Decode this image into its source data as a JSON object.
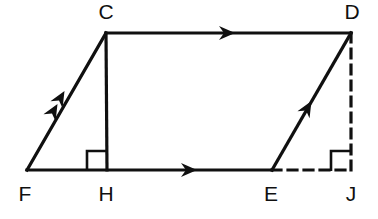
{
  "figure": {
    "background_color": "#ffffff",
    "stroke_color": "#101010",
    "solid_stroke_width": 3.2,
    "dashed_stroke_width": 3.2,
    "dash_pattern": "9 7",
    "canvas": {
      "width": 378,
      "height": 219
    }
  },
  "vertices": [
    {
      "id": "C",
      "label": "C",
      "x": 106,
      "y": 33,
      "label_x": 106,
      "label_y": 13
    },
    {
      "id": "D",
      "label": "D",
      "x": 351,
      "y": 33,
      "label_x": 352,
      "label_y": 13
    },
    {
      "id": "F",
      "label": "F",
      "x": 27,
      "y": 170,
      "label_x": 25,
      "label_y": 195
    },
    {
      "id": "H",
      "label": "H",
      "x": 107,
      "y": 170,
      "label_x": 106,
      "label_y": 195
    },
    {
      "id": "E",
      "label": "E",
      "x": 272,
      "y": 170,
      "label_x": 271,
      "label_y": 195
    },
    {
      "id": "J",
      "label": "J",
      "x": 351,
      "y": 170,
      "label_x": 351,
      "label_y": 195
    }
  ],
  "segments": [
    {
      "id": "FC",
      "name": "segment-fc",
      "from": "F",
      "to": "C",
      "style": "solid",
      "x1": 27,
      "y1": 170,
      "x2": 106,
      "y2": 33
    },
    {
      "id": "CD",
      "name": "segment-cd",
      "from": "C",
      "to": "D",
      "style": "solid",
      "x1": 106,
      "y1": 33,
      "x2": 351,
      "y2": 33
    },
    {
      "id": "ED",
      "name": "segment-ed",
      "from": "E",
      "to": "D",
      "style": "solid",
      "x1": 272,
      "y1": 170,
      "x2": 351,
      "y2": 33
    },
    {
      "id": "FE",
      "name": "segment-fe",
      "from": "F",
      "to": "E",
      "style": "solid",
      "x1": 27,
      "y1": 170,
      "x2": 272,
      "y2": 170
    },
    {
      "id": "CH",
      "name": "segment-ch-altitude",
      "from": "C",
      "to": "H",
      "style": "solid",
      "x1": 106,
      "y1": 33,
      "x2": 107,
      "y2": 170
    },
    {
      "id": "EJ",
      "name": "segment-ej-dashed",
      "from": "E",
      "to": "J",
      "style": "dashed",
      "x1": 272,
      "y1": 170,
      "x2": 351,
      "y2": 170
    },
    {
      "id": "DJ",
      "name": "segment-dj-dashed-altitude",
      "from": "D",
      "to": "J",
      "style": "dashed",
      "x1": 351,
      "y1": 33,
      "x2": 351,
      "y2": 170
    }
  ],
  "arrow_marks": [
    {
      "id": "arrow-cd",
      "name": "direction-arrow-cd",
      "on": "CD",
      "count": 1,
      "x": 228,
      "y": 33,
      "angle": 0
    },
    {
      "id": "arrow-fe",
      "name": "direction-arrow-fe",
      "on": "FE",
      "count": 1,
      "x": 190,
      "y": 170,
      "angle": 0
    },
    {
      "id": "arrow-fc-1",
      "name": "direction-arrow-fc-outer",
      "on": "FC",
      "count": 2,
      "x": 61,
      "y": 97,
      "angle": -60
    },
    {
      "id": "arrow-fc-2",
      "name": "direction-arrow-fc-inner",
      "on": "FC",
      "count": 2,
      "x": 54,
      "y": 110,
      "angle": -60
    },
    {
      "id": "arrow-ed",
      "name": "direction-arrow-ed",
      "on": "ED",
      "count": 1,
      "x": 308,
      "y": 107,
      "angle": -60
    }
  ],
  "right_angle_marks": [
    {
      "id": "right-angle-h",
      "name": "right-angle-mark-h",
      "at": "H",
      "x": 87,
      "y": 151,
      "size": 20,
      "opens": "left"
    },
    {
      "id": "right-angle-j",
      "name": "right-angle-mark-j",
      "at": "J",
      "x": 331,
      "y": 151,
      "size": 20,
      "opens": "left"
    }
  ]
}
